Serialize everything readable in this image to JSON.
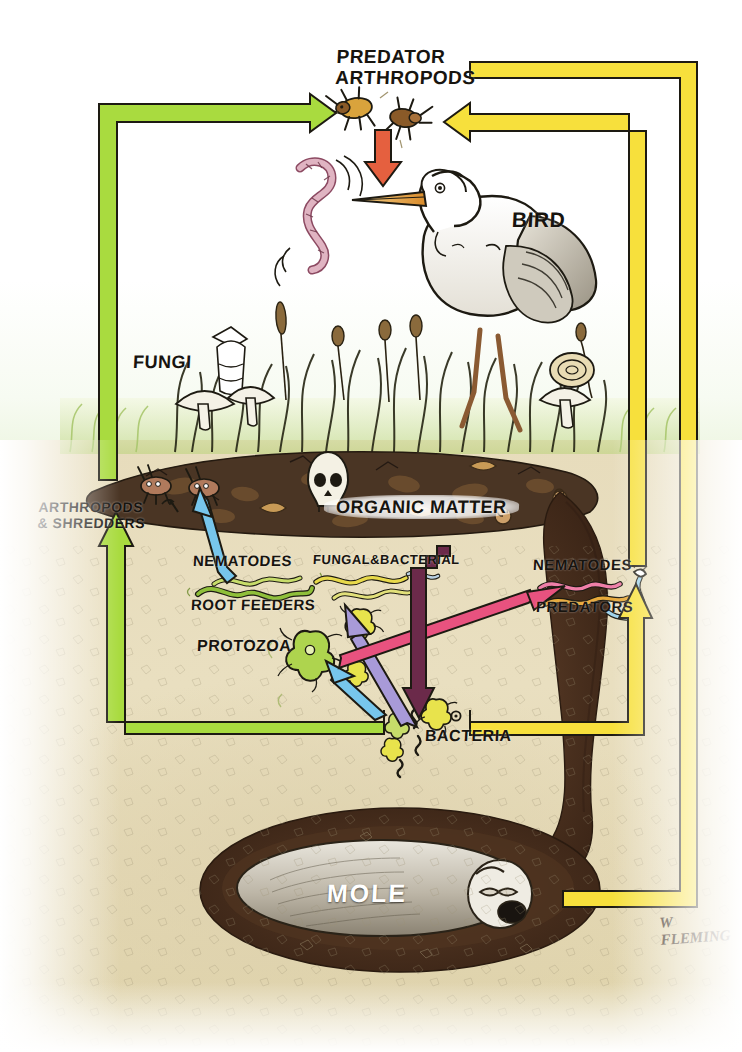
{
  "credit": {
    "signature": "W FLEMING"
  },
  "colors": {
    "arrow_green": "#a9db3f",
    "arrow_yellow": "#f7e03c",
    "arrow_orange": "#e5603f",
    "arrow_blue": "#77c6ec",
    "arrow_purple": "#a89ad8",
    "arrow_pink": "#e8527f",
    "arrow_plum": "#6b2a4a",
    "soil": "#e7dcbc",
    "subsoil": "#ded2a8",
    "grass": "#cfe39a",
    "organic_matter": "#4a3524",
    "burrow": "#4a3122",
    "outline": "#171310"
  },
  "labels": {
    "predator_arthropods": "PREDATOR\nARTHROPODS",
    "bird": "BIRD",
    "fungi": "FUNGI",
    "arthropods_shredders": "ARTHROPODS\n& SHREDDERS",
    "organic_matter": "ORGANIC MATTER",
    "nematodes_root": "NEMATODES",
    "root_feeders": "ROOT FEEDERS",
    "fungal_bacterial": "FUNGAL&BACTERIAL",
    "protozoa": "PROTOZOA",
    "nematodes_pred": "NEMATODES",
    "predators": "PREDATORS",
    "bacteria": "BACTERIA",
    "mole": "MOLE"
  },
  "organisms": [
    {
      "key": "predator_arthropods",
      "label": "PREDATOR ARTHROPODS",
      "tier": "above-ground predator"
    },
    {
      "key": "bird",
      "label": "BIRD",
      "tier": "above-ground predator"
    },
    {
      "key": "fungi",
      "label": "FUNGI",
      "tier": "decomposer"
    },
    {
      "key": "arthropods_shredders",
      "label": "ARTHROPODS & SHREDDERS",
      "tier": "surface shredder"
    },
    {
      "key": "organic_matter",
      "label": "ORGANIC MATTER",
      "tier": "substrate"
    },
    {
      "key": "nematodes_root_feeders",
      "label": "NEMATODES ROOT FEEDERS",
      "tier": "soil grazer"
    },
    {
      "key": "fungal_bacterial",
      "label": "FUNGAL&BACTERIAL",
      "tier": "soil grazer"
    },
    {
      "key": "protozoa",
      "label": "PROTOZOA",
      "tier": "soil grazer"
    },
    {
      "key": "nematodes_predators",
      "label": "NEMATODES PREDATORS",
      "tier": "soil predator"
    },
    {
      "key": "bacteria",
      "label": "BACTERIA",
      "tier": "decomposer"
    },
    {
      "key": "mole",
      "label": "MOLE",
      "tier": "sub-soil predator"
    }
  ],
  "flows": [
    {
      "from": "bacteria",
      "to": "arthropods-shredders",
      "color": "#a9db3f",
      "name": "green-left-loop"
    },
    {
      "from": "arthropods-shredders",
      "to": "predator-arthropods",
      "color": "#a9db3f",
      "name": "green-up-loop"
    },
    {
      "from": "predator-arthropods",
      "to": "bird",
      "color": "#e5603f",
      "name": "orange-down"
    },
    {
      "from": "nematodes-predators",
      "to": "predator-arthropods",
      "color": "#f7e03c",
      "name": "yellow-inner-loop"
    },
    {
      "from": "mole",
      "to": "predator-arthropods",
      "color": "#f7e03c",
      "name": "yellow-outer-loop"
    },
    {
      "from": "bacteria",
      "to": "nematodes-predators",
      "color": "#f7e03c",
      "name": "yellow-up-short"
    },
    {
      "from": "bacteria-protozoa",
      "to": "arthropods-shredders",
      "color": "#77c6ec",
      "name": "blue-surface"
    },
    {
      "from": "bacteria",
      "to": "protozoa",
      "color": "#77c6ec",
      "name": "blue-short"
    },
    {
      "from": "bacteria",
      "to": "fungal-bacterial",
      "color": "#a89ad8",
      "name": "purple-up"
    },
    {
      "from": "protozoa",
      "to": "nematodes-predators",
      "color": "#e8527f",
      "name": "pink-right"
    },
    {
      "from": "organic-matter",
      "to": "bacteria",
      "color": "#6b2a4a",
      "name": "plum-down"
    }
  ]
}
